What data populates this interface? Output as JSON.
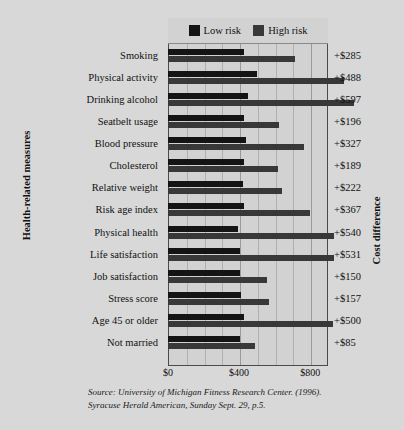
{
  "chart_data": {
    "type": "bar",
    "orientation": "horizontal",
    "title": "",
    "xlabel": "",
    "ylabel": "Health-related measures",
    "y2label": "Cost difference",
    "xlim": [
      0,
      900
    ],
    "xticks": [
      0,
      400,
      800
    ],
    "xticklabels": [
      "$0",
      "$400",
      "$800"
    ],
    "grid": true,
    "grid_axis": "x",
    "grid_interval": 100,
    "legend_position": "top-inside",
    "legend": [
      {
        "name": "Low risk",
        "color": "#141414"
      },
      {
        "name": "High risk",
        "color": "#383838"
      }
    ],
    "categories": [
      "Smoking",
      "Physical activity",
      "Drinking alcohol",
      "Seatbelt usage",
      "Blood pressure",
      "Cholesterol",
      "Relative weight",
      "Risk age index",
      "Physical health",
      "Life satisfaction",
      "Job satisfaction",
      "Stress score",
      "Age 45 or older",
      "Not married"
    ],
    "series": [
      {
        "name": "Low risk",
        "color": "#141414",
        "values": [
          430,
          500,
          450,
          430,
          440,
          430,
          420,
          430,
          395,
          405,
          405,
          410,
          430,
          405
        ]
      },
      {
        "name": "High risk",
        "color": "#383838",
        "values": [
          715,
          988,
          1047,
          626,
          767,
          619,
          642,
          797,
          935,
          936,
          555,
          567,
          930,
          490
        ]
      }
    ],
    "annotations": [
      {
        "category": "Smoking",
        "label": "+$285",
        "value": 285
      },
      {
        "category": "Physical activity",
        "label": "+$488",
        "value": 488
      },
      {
        "category": "Drinking alcohol",
        "label": "+$597",
        "value": 597
      },
      {
        "category": "Seatbelt usage",
        "label": "+$196",
        "value": 196
      },
      {
        "category": "Blood pressure",
        "label": "+$327",
        "value": 327
      },
      {
        "category": "Cholesterol",
        "label": "+$189",
        "value": 189
      },
      {
        "category": "Relative weight",
        "label": "+$222",
        "value": 222
      },
      {
        "category": "Risk age index",
        "label": "+$367",
        "value": 367
      },
      {
        "category": "Physical health",
        "label": "+$540",
        "value": 540
      },
      {
        "category": "Life satisfaction",
        "label": "+$531",
        "value": 531
      },
      {
        "category": "Job satisfaction",
        "label": "+$150",
        "value": 150
      },
      {
        "category": "Stress score",
        "label": "+$157",
        "value": 157
      },
      {
        "category": "Age 45 or older",
        "label": "+$500",
        "value": 500
      },
      {
        "category": "Not married",
        "label": "+$85",
        "value": 85
      }
    ]
  },
  "source": {
    "line1": "Source: University of Michigan Fitness Research Center. (1996).",
    "line2": "Syracuse Herald American, Sunday Sept. 29, p.5."
  }
}
